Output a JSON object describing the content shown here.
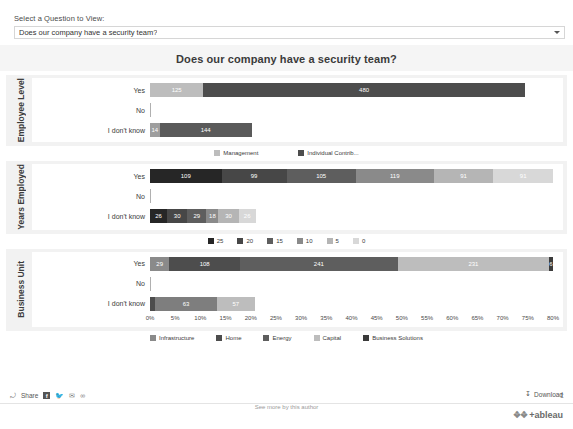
{
  "filter": {
    "label": "Select a Question to View:",
    "selected": "Does our company have a security team?",
    "caret_icon": "chevron-down-icon"
  },
  "dashboard": {
    "title": "Does our company have a security team?"
  },
  "axis": {
    "ticks": [
      "0%",
      "5%",
      "10%",
      "15%",
      "20%",
      "25%",
      "30%",
      "35%",
      "40%",
      "45%",
      "50%",
      "55%",
      "60%",
      "65%",
      "70%",
      "75%",
      "80%"
    ],
    "min": 0,
    "max": 80
  },
  "row_labels": [
    "Yes",
    "No",
    "I don't know"
  ],
  "bottom_bar": {
    "share_label": "Share",
    "facebook_icon": "facebook-icon",
    "twitter_icon": "twitter-icon",
    "email_icon": "email-icon",
    "link_icon": "link-icon",
    "share_arrow_icon": "share-arrow-icon",
    "upload_icon": "upload-icon",
    "download_label": "Download",
    "download_icon": "download-arrow-icon",
    "author_text": "See more by this author",
    "logo_text": "+ableau",
    "logo_mark_icon": "tableau-logo-icon"
  },
  "chart_data": [
    {
      "type": "bar",
      "panel_title": "Employee Level",
      "orientation": "horizontal",
      "stacked": true,
      "xlabel": "",
      "ylabel": "Employee Level",
      "xlim": [
        0,
        80
      ],
      "grid": false,
      "legend_position": "bottom",
      "categories": [
        "Yes",
        "No",
        "I don't know"
      ],
      "series": [
        {
          "name": "Management",
          "color": "#bdbdbd",
          "values": [
            125,
            0,
            14
          ]
        },
        {
          "name": "Individual Contrib...",
          "color": "#4d4d4d",
          "values": [
            480,
            0,
            144
          ]
        }
      ],
      "bars": [
        {
          "category": "Yes",
          "segments": [
            {
              "label": "125",
              "value": 125,
              "color": "#bdbdbd",
              "width_pct": 10.6
            },
            {
              "label": "480",
              "value": 480,
              "color": "#4d4d4d",
              "width_pct": 63.8
            }
          ]
        },
        {
          "category": "No",
          "segments": []
        },
        {
          "category": "I don't know",
          "segments": [
            {
              "label": "14",
              "value": 14,
              "color": "#9e9e9e",
              "width_pct": 1.9
            },
            {
              "label": "144",
              "value": 144,
              "color": "#5a5a5a",
              "width_pct": 18.3
            }
          ]
        }
      ]
    },
    {
      "type": "bar",
      "panel_title": "Years Employed",
      "orientation": "horizontal",
      "stacked": true,
      "xlabel": "",
      "ylabel": "Years Employed",
      "xlim": [
        0,
        80
      ],
      "grid": false,
      "legend_position": "bottom",
      "categories": [
        "Yes",
        "No",
        "I don't know"
      ],
      "series": [
        {
          "name": "25",
          "color": "#262626",
          "values": [
            109,
            0,
            26
          ]
        },
        {
          "name": "20",
          "color": "#474747",
          "values": [
            99,
            0,
            30
          ]
        },
        {
          "name": "15",
          "color": "#5e5e5e",
          "values": [
            105,
            0,
            29
          ]
        },
        {
          "name": "10",
          "color": "#8a8a8a",
          "values": [
            119,
            0,
            18
          ]
        },
        {
          "name": "5",
          "color": "#b5b5b5",
          "values": [
            91,
            0,
            30
          ]
        },
        {
          "name": "0",
          "color": "#d8d8d8",
          "values": [
            91,
            0,
            26
          ]
        }
      ],
      "bars": [
        {
          "category": "Yes",
          "segments": [
            {
              "label": "109",
              "value": 109,
              "color": "#262626",
              "width_pct": 14.4
            },
            {
              "label": "99",
              "value": 99,
              "color": "#474747",
              "width_pct": 13.1
            },
            {
              "label": "105",
              "value": 105,
              "color": "#5e5e5e",
              "width_pct": 13.9
            },
            {
              "label": "119",
              "value": 119,
              "color": "#8a8a8a",
              "width_pct": 15.7
            },
            {
              "label": "91",
              "value": 91,
              "color": "#b5b5b5",
              "width_pct": 12.0
            },
            {
              "label": "91",
              "value": 91,
              "color": "#d8d8d8",
              "width_pct": 12.0
            }
          ]
        },
        {
          "category": "No",
          "segments": []
        },
        {
          "category": "I don't know",
          "segments": [
            {
              "label": "26",
              "value": 26,
              "color": "#262626",
              "width_pct": 3.4
            },
            {
              "label": "30",
              "value": 30,
              "color": "#474747",
              "width_pct": 4.0
            },
            {
              "label": "29",
              "value": 29,
              "color": "#5e5e5e",
              "width_pct": 3.8
            },
            {
              "label": "18",
              "value": 18,
              "color": "#8a8a8a",
              "width_pct": 2.4
            },
            {
              "label": "30",
              "value": 30,
              "color": "#b5b5b5",
              "width_pct": 4.0
            },
            {
              "label": "26",
              "value": 26,
              "color": "#d8d8d8",
              "width_pct": 3.4
            }
          ]
        }
      ]
    },
    {
      "type": "bar",
      "panel_title": "Business Unit",
      "orientation": "horizontal",
      "stacked": true,
      "xlabel": "",
      "ylabel": "Business Unit",
      "xlim": [
        0,
        80
      ],
      "grid": false,
      "legend_position": "bottom",
      "categories": [
        "Yes",
        "No",
        "I don't know"
      ],
      "series": [
        {
          "name": "Infrastructure",
          "color": "#8a8a8a",
          "values": [
            29,
            0,
            2
          ]
        },
        {
          "name": "Home",
          "color": "#4d4d4d",
          "values": [
            108,
            0,
            63
          ]
        },
        {
          "name": "Energy",
          "color": "#5e5e5e",
          "values": [
            241,
            0,
            0
          ]
        },
        {
          "name": "Capital",
          "color": "#bdbdbd",
          "values": [
            231,
            0,
            57
          ]
        },
        {
          "name": "Business Solutions",
          "color": "#3b3b3b",
          "values": [
            6,
            0,
            0
          ]
        }
      ],
      "bars": [
        {
          "category": "Yes",
          "segments": [
            {
              "label": "29",
              "value": 29,
              "color": "#8a8a8a",
              "width_pct": 3.9
            },
            {
              "label": "108",
              "value": 108,
              "color": "#4d4d4d",
              "width_pct": 14.3
            },
            {
              "label": "241",
              "value": 241,
              "color": "#5e5e5e",
              "width_pct": 31.9
            },
            {
              "label": "231",
              "value": 231,
              "color": "#bdbdbd",
              "width_pct": 30.6
            },
            {
              "label": "6",
              "value": 6,
              "color": "#3b3b3b",
              "width_pct": 0.8
            }
          ]
        },
        {
          "category": "No",
          "segments": []
        },
        {
          "category": "I don't know",
          "segments": [
            {
              "label": "",
              "value": 2,
              "color": "#4d4d4d",
              "width_pct": 1.0
            },
            {
              "label": "63",
              "value": 63,
              "color": "#7e7e7e",
              "width_pct": 12.3
            },
            {
              "label": "57",
              "value": 57,
              "color": "#bdbdbd",
              "width_pct": 7.5
            }
          ]
        }
      ]
    }
  ]
}
